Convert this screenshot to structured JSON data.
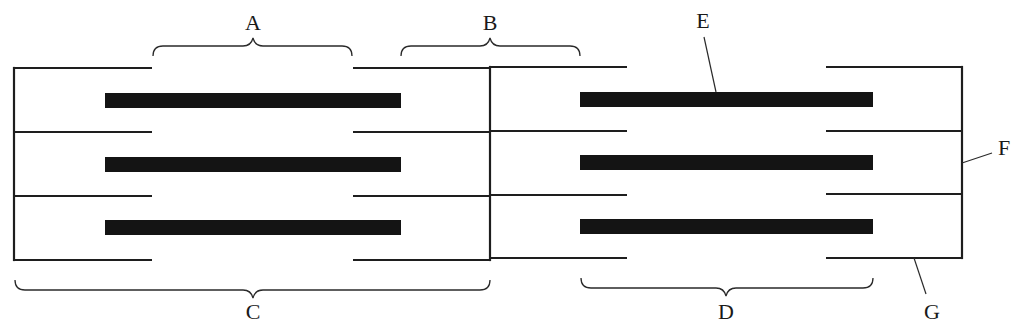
{
  "diagram": {
    "labels": {
      "A": "A",
      "B": "B",
      "C": "C",
      "D": "D",
      "E": "E",
      "F": "F",
      "G": "G"
    },
    "colors": {
      "line": "#1e1e1e",
      "bar": "#141414",
      "background": "#ffffff"
    }
  }
}
